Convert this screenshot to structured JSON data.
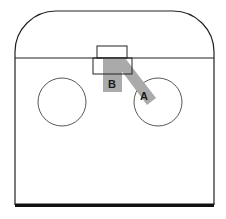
{
  "diagram": {
    "labels": {
      "a": "A",
      "b": "B"
    },
    "colors": {
      "outline": "#222222",
      "shade": "#aaaaaa",
      "baseline": "#111111",
      "background": "#ffffff"
    }
  }
}
